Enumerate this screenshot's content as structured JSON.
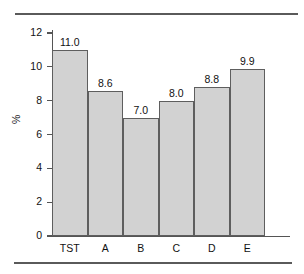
{
  "chart_data": {
    "type": "bar",
    "title": "",
    "xlabel": "",
    "ylabel": "%",
    "categories": [
      "TST",
      "A",
      "B",
      "C",
      "D",
      "E"
    ],
    "values": [
      11.0,
      8.6,
      7.0,
      8.0,
      8.8,
      9.9
    ],
    "value_labels": [
      "11.0",
      "8.6",
      "7.0",
      "8.0",
      "8.8",
      "9.9"
    ],
    "ylim": [
      0,
      12
    ],
    "ytick_values": [
      0,
      2,
      4,
      6,
      8,
      10,
      12
    ],
    "ytick_labels": [
      "0",
      "2",
      "4",
      "6",
      "8",
      "10",
      "12"
    ],
    "grid": false,
    "legend": null,
    "bar_fill_color": "#d2d2d2",
    "bar_edge_color": "#5e5e5e",
    "axis_color": "#555555",
    "text_color": "#111111"
  },
  "decorations": {
    "rule_top": "",
    "rule_bottom": ""
  }
}
